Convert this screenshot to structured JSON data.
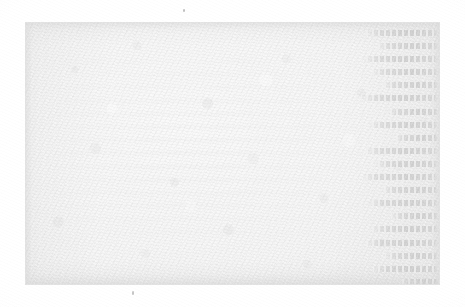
{
  "document": {
    "kind": "scanned-page",
    "page_appearance": "blank",
    "visible_text": "",
    "background_color": "#fdfdfd",
    "paper_color": "#f0f0f0",
    "paper_edge_color": "#e2e2e2",
    "showthrough_color": "#c4c4c4",
    "speck_color": "#8c8c8c"
  },
  "paper": {
    "left_px": 25,
    "top_px": 22,
    "width_px": 415,
    "height_px": 263
  },
  "showthrough": {
    "description": "mirrored bleed-through of text printed on the reverse side",
    "legible": false,
    "mirrored": true,
    "column_side": "right",
    "line_count": 20,
    "line_spacing_px": 13.1,
    "lines": [
      {
        "width_pct": 92
      },
      {
        "width_pct": 78
      },
      {
        "width_pct": 96
      },
      {
        "width_pct": 85
      },
      {
        "width_pct": 70
      },
      {
        "width_pct": 99
      },
      {
        "width_pct": 64
      },
      {
        "width_pct": 88
      },
      {
        "width_pct": 55
      },
      {
        "width_pct": 93
      },
      {
        "width_pct": 81
      },
      {
        "width_pct": 97
      },
      {
        "width_pct": 72
      },
      {
        "width_pct": 90
      },
      {
        "width_pct": 60
      },
      {
        "width_pct": 86
      },
      {
        "width_pct": 94
      },
      {
        "width_pct": 68
      },
      {
        "width_pct": 83
      },
      {
        "width_pct": 48
      }
    ]
  },
  "artifacts": {
    "specks": [
      {
        "name": "dust-speck-top",
        "x_px": 183,
        "y_px": 9
      },
      {
        "name": "dust-speck-bottom",
        "x_px": 132,
        "y_px": 291
      }
    ]
  }
}
